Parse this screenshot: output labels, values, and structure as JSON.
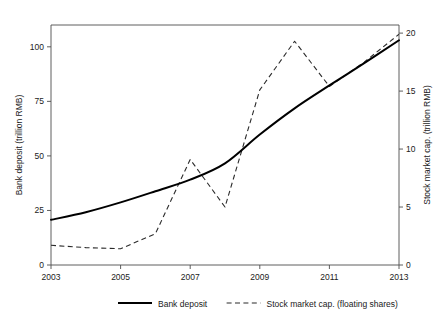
{
  "chart_data": {
    "type": "line",
    "title": "",
    "xlabel": "",
    "ylabel": "Bank deposit (trillion RMB)",
    "y2label": "Stock market cap. (trillion RMB)",
    "x": [
      2003,
      2004,
      2005,
      2006,
      2007,
      2008,
      2009,
      2010,
      2011,
      2012,
      2013
    ],
    "xlim": [
      2003,
      2013
    ],
    "xticks": [
      2003,
      2005,
      2007,
      2009,
      2011,
      2013
    ],
    "xtick_labels": [
      "2003",
      "2005",
      "2007",
      "2009",
      "2011",
      "2013"
    ],
    "ylim": [
      0,
      110
    ],
    "yticks": [
      0,
      25,
      50,
      75,
      100
    ],
    "ytick_labels": [
      "0",
      "25",
      "50",
      "75",
      "100"
    ],
    "y2lim": [
      0,
      20.7
    ],
    "y2ticks": [
      0,
      5,
      10,
      15,
      20
    ],
    "y2tick_labels": [
      "0",
      "5",
      "10",
      "15",
      "20"
    ],
    "grid": false,
    "legend_position": "below",
    "series": [
      {
        "name": "Bank deposit",
        "axis": "left",
        "style": "solid",
        "color": "#000000",
        "values": [
          20.7,
          24.2,
          28.7,
          33.8,
          39.1,
          46.6,
          59.8,
          71.8,
          82.3,
          92.5,
          103.0
        ]
      },
      {
        "name": "Stock market cap. (floating shares)",
        "axis": "right",
        "style": "dashed",
        "color": "#2b2b2b",
        "values": [
          1.7,
          1.5,
          1.4,
          2.7,
          9.1,
          5.0,
          15.1,
          19.3,
          15.4,
          17.5,
          19.9
        ]
      }
    ]
  },
  "axes": {
    "left_title": "Bank deposit (trillion RMB)",
    "right_title": "Stock market cap. (trillion RMB)"
  },
  "legend": {
    "entries": [
      {
        "label": "Bank deposit",
        "style": "solid"
      },
      {
        "label": "Stock market cap. (floating shares)",
        "style": "dashed"
      }
    ]
  }
}
